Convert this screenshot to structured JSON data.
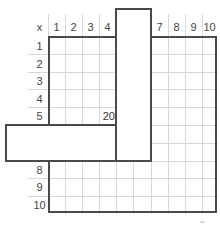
{
  "puzzle": {
    "corner_label": "x",
    "column_headers": [
      "1",
      "2",
      "3",
      "4",
      "",
      "",
      "7",
      "8",
      "9",
      "10"
    ],
    "row_headers": [
      "1",
      "2",
      "3",
      "4",
      "5",
      "",
      "",
      "8",
      "9",
      "10"
    ],
    "cells": [
      {
        "row": 5,
        "col": 4,
        "value": "20"
      }
    ],
    "covering_shape": "L-shaped piece covering columns 5-6 (extending above grid) and rows 6-7 (extending left of grid)",
    "colors": {
      "border": "#4a4a4a",
      "gridline": "#d8d8d8",
      "background": "#ffffff",
      "text": "#333333"
    }
  }
}
